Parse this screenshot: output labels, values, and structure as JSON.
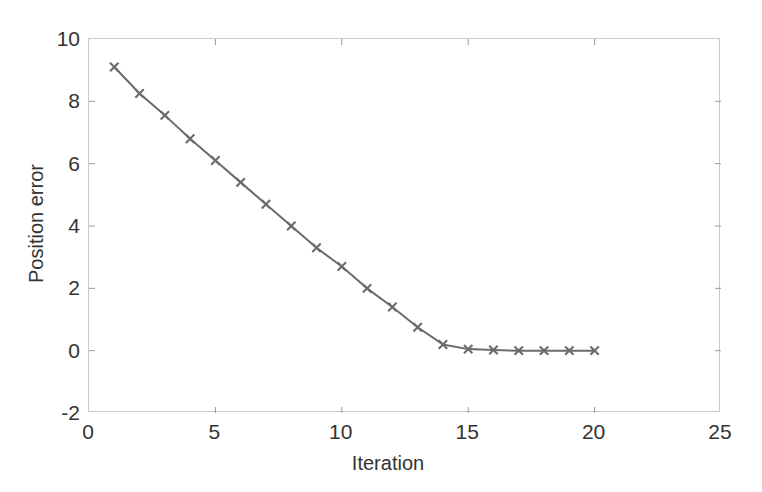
{
  "chart_data": {
    "type": "line",
    "title": "",
    "xlabel": "Iteration",
    "ylabel": "Position error",
    "xlim": [
      0,
      25
    ],
    "ylim": [
      -2,
      10
    ],
    "xticks": [
      0,
      5,
      10,
      15,
      20,
      25
    ],
    "yticks": [
      -2,
      0,
      2,
      4,
      6,
      8,
      10
    ],
    "xtick_labels": [
      "0",
      "5",
      "10",
      "15",
      "20",
      "25"
    ],
    "ytick_labels": [
      "-2",
      "0",
      "2",
      "4",
      "6",
      "8",
      "10"
    ],
    "grid": false,
    "legend": null,
    "series": [
      {
        "name": "position error",
        "color": "#6b6b6b",
        "marker": "x",
        "line_width": 2,
        "x": [
          1,
          2,
          3,
          4,
          5,
          6,
          7,
          8,
          9,
          10,
          11,
          12,
          13,
          14,
          15,
          16,
          17,
          18,
          19,
          20
        ],
        "values": [
          9.1,
          8.25,
          7.55,
          6.8,
          6.1,
          5.4,
          4.7,
          4.0,
          3.3,
          2.7,
          2.0,
          1.4,
          0.75,
          0.2,
          0.05,
          0.02,
          0.0,
          0.0,
          0.0,
          0.0
        ]
      }
    ]
  },
  "axes": {
    "border_color": "#c9c9c9",
    "tick_color": "#9a9a9a",
    "text_color": "#333333"
  }
}
